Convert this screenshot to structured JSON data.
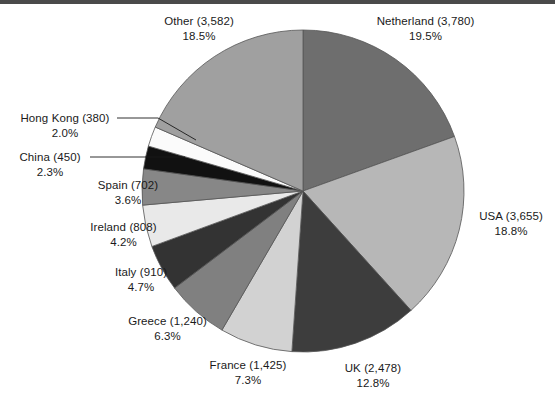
{
  "chart_data": {
    "type": "pie",
    "title": "",
    "subtitle": "",
    "xlabel": "",
    "ylabel": "",
    "legend_position": "none",
    "grid": false,
    "value_format": "count_with_percent",
    "start_angle_deg": 0,
    "direction": "clockwise",
    "categories": [
      "Netherland",
      "USA",
      "UK",
      "France",
      "Greece",
      "Italy",
      "Ireland",
      "Spain",
      "China",
      "Hong Kong",
      "Other"
    ],
    "values": [
      3780,
      3655,
      2478,
      1425,
      1240,
      910,
      808,
      702,
      450,
      380,
      3582
    ],
    "percentages": [
      19.5,
      18.8,
      12.8,
      7.3,
      6.3,
      4.7,
      4.2,
      3.6,
      2.3,
      2.0,
      18.5
    ],
    "colors": [
      "#6e6e6e",
      "#b7b7b7",
      "#3d3d3d",
      "#d2d2d2",
      "#808080",
      "#333333",
      "#e9e9e9",
      "#878787",
      "#111111",
      "#fbfbfb",
      "#a0a0a0"
    ],
    "slices": [
      {
        "name": "Netherland",
        "value": 3780,
        "percent": 19.5,
        "value_text": "3,780",
        "label": "Netherland (3,780)",
        "percent_text": "19.5%",
        "color": "#6e6e6e",
        "leader_line": false
      },
      {
        "name": "USA",
        "value": 3655,
        "percent": 18.8,
        "value_text": "3,655",
        "label": "USA (3,655)",
        "percent_text": "18.8%",
        "color": "#b7b7b7",
        "leader_line": false
      },
      {
        "name": "UK",
        "value": 2478,
        "percent": 12.8,
        "value_text": "2,478",
        "label": "UK (2,478)",
        "percent_text": "12.8%",
        "color": "#3d3d3d",
        "leader_line": false
      },
      {
        "name": "France",
        "value": 1425,
        "percent": 7.3,
        "value_text": "1,425",
        "label": "France (1,425)",
        "percent_text": "7.3%",
        "color": "#d2d2d2",
        "leader_line": false
      },
      {
        "name": "Greece",
        "value": 1240,
        "percent": 6.3,
        "value_text": "1,240",
        "label": "Greece (1,240)",
        "percent_text": "6.3%",
        "color": "#808080",
        "leader_line": false
      },
      {
        "name": "Italy",
        "value": 910,
        "percent": 4.7,
        "value_text": "910",
        "label": "Italy (910)",
        "percent_text": "4.7%",
        "color": "#333333",
        "leader_line": false
      },
      {
        "name": "Ireland",
        "value": 808,
        "percent": 4.2,
        "value_text": "808",
        "label": "Ireland (808)",
        "percent_text": "4.2%",
        "color": "#e9e9e9",
        "leader_line": false
      },
      {
        "name": "Spain",
        "value": 702,
        "percent": 3.6,
        "value_text": "702",
        "label": "Spain (702)",
        "percent_text": "3.6%",
        "color": "#878787",
        "leader_line": false
      },
      {
        "name": "China",
        "value": 450,
        "percent": 2.3,
        "value_text": "450",
        "label": "China (450)",
        "percent_text": "2.3%",
        "color": "#111111",
        "leader_line": true
      },
      {
        "name": "Hong Kong",
        "value": 380,
        "percent": 2.0,
        "value_text": "380",
        "label": "Hong Kong (380)",
        "percent_text": "2.0%",
        "color": "#fbfbfb",
        "leader_line": true
      },
      {
        "name": "Other",
        "value": 3582,
        "percent": 18.5,
        "value_text": "3,582",
        "label": "Other (3,582)",
        "percent_text": "18.5%",
        "color": "#a0a0a0",
        "leader_line": false
      }
    ]
  },
  "figure": {
    "background_color": "#ffffff",
    "outline_color": "#555555",
    "text_color": "#1a1a1a"
  }
}
